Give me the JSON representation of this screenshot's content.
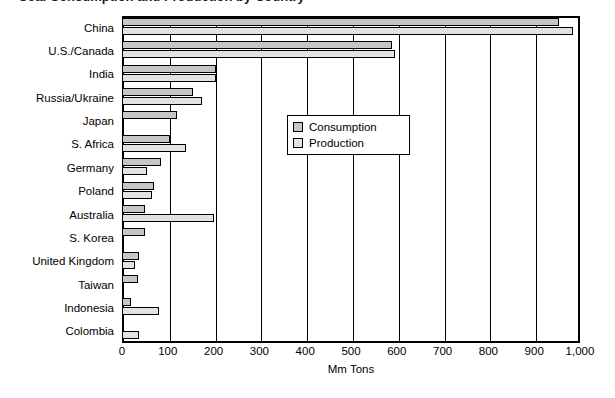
{
  "title": {
    "text_partial": "Coal Consumption and Production by Country"
  },
  "chart_data": {
    "type": "bar",
    "orientation": "horizontal",
    "title": "",
    "xlabel": "Mm Tons",
    "ylabel": "",
    "xlim": [
      0,
      1000
    ],
    "xticks": [
      0,
      100,
      200,
      300,
      400,
      500,
      600,
      700,
      800,
      900,
      1000
    ],
    "xtick_labels": [
      "0",
      "100",
      "200",
      "300",
      "400",
      "500",
      "600",
      "700",
      "800",
      "900",
      "1,000"
    ],
    "grid": true,
    "legend_position": "center",
    "categories": [
      "China",
      "U.S./Canada",
      "India",
      "Russia/Ukraine",
      "Japan",
      "S. Africa",
      "Germany",
      "Poland",
      "Australia",
      "S. Korea",
      "United Kingdom",
      "Taiwan",
      "Indonesia",
      "Colombia"
    ],
    "series": [
      {
        "name": "Consumption",
        "color": "#c6c6c6",
        "values": [
          955,
          590,
          205,
          155,
          120,
          105,
          85,
          70,
          50,
          50,
          38,
          35,
          20,
          5
        ]
      },
      {
        "name": "Production",
        "color": "#e2e2e2",
        "values": [
          985,
          595,
          205,
          175,
          5,
          140,
          55,
          65,
          200,
          3,
          28,
          2,
          80,
          38
        ]
      }
    ]
  },
  "legend": {
    "items": [
      {
        "label": "Consumption",
        "color": "#c6c6c6"
      },
      {
        "label": "Production",
        "color": "#e2e2e2"
      }
    ]
  }
}
